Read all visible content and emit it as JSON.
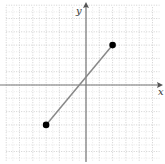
{
  "figure": {
    "type": "coordinate-plane-segment",
    "axes": {
      "x_label": "x",
      "y_label": "y"
    },
    "grid": {
      "x_min": -6,
      "x_max": 5,
      "y_min": -6,
      "y_max": 6,
      "unit_px": 13.3
    },
    "segment": {
      "start": {
        "x": -3,
        "y": -3
      },
      "end": {
        "x": 2,
        "y": 3
      }
    },
    "colors": {
      "grid": "#c8c8c8",
      "axis": "#777777",
      "segment": "#888888",
      "point": "#000000"
    }
  }
}
